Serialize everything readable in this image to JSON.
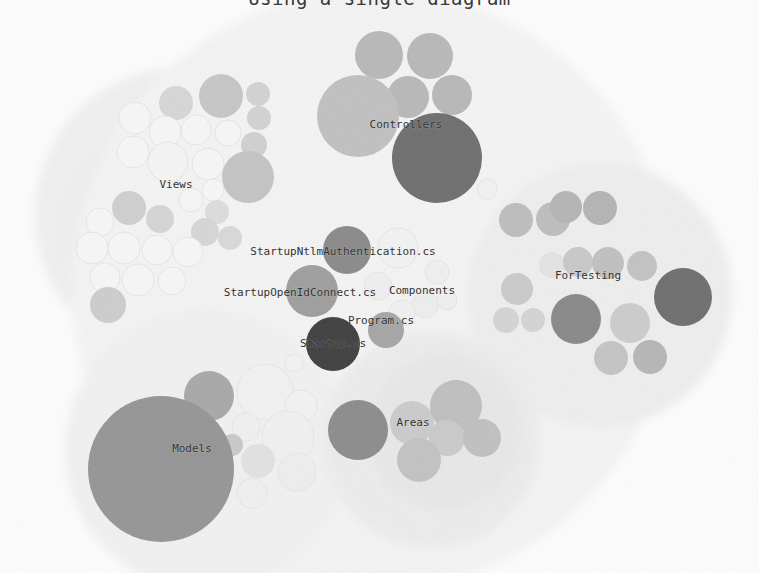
{
  "page": {
    "title_sliver": "Using a single diagram",
    "background_color": "#fdfdfd",
    "width": 759,
    "height": 573
  },
  "palette": {
    "hull": "#f0f0f0",
    "hull_inner": "#ececec",
    "leaf_faint": "#fafafa",
    "leaf_faint_stroke": "#e6e6e6",
    "leaf_light": "#d2d2d2",
    "leaf_mid": "#b8b8b8",
    "leaf_dark": "#8f8f8f",
    "leaf_darker": "#6e6e6e",
    "leaf_darkest": "#3f3f3f",
    "label": "#2b2b2b"
  },
  "chart_data": {
    "type": "bubble",
    "title": "Using a single diagram",
    "xlabel": "",
    "ylabel": "",
    "legend_position": "none",
    "grid": false,
    "xlim": [
      0,
      759
    ],
    "ylim": [
      0,
      573
    ],
    "labels": [
      {
        "text": "Controllers",
        "x": 406,
        "y": 125,
        "size": 11
      },
      {
        "text": "Views",
        "x": 176,
        "y": 185,
        "size": 11
      },
      {
        "text": "StartupNtlmAuthentication.cs",
        "x": 343,
        "y": 252,
        "size": 11
      },
      {
        "text": "StartupOpenIdConnect.cs",
        "x": 300,
        "y": 293,
        "size": 11
      },
      {
        "text": "Components",
        "x": 422,
        "y": 291,
        "size": 11
      },
      {
        "text": "Program.cs",
        "x": 381,
        "y": 321,
        "size": 11
      },
      {
        "text": "Startup.cs",
        "x": 333,
        "y": 344,
        "size": 11
      },
      {
        "text": "ForTesting",
        "x": 588,
        "y": 276,
        "size": 11
      },
      {
        "text": "Models",
        "x": 192,
        "y": 449,
        "size": 11
      },
      {
        "text": "Areas",
        "x": 413,
        "y": 423,
        "size": 11
      }
    ],
    "hulls": [
      {
        "name": "views-hull",
        "cx": 183,
        "cy": 215,
        "r": 148,
        "fill": "#f0f0f0"
      },
      {
        "name": "views-inner-hull",
        "cx": 168,
        "cy": 232,
        "r": 108,
        "fill": "#efefef"
      },
      {
        "name": "controllers-hull",
        "cx": 414,
        "cy": 140,
        "r": 118,
        "fill": "#f1f1f1"
      },
      {
        "name": "root-hull",
        "cx": 372,
        "cy": 290,
        "r": 300,
        "fill": "#f4f4f4"
      },
      {
        "name": "fortesting-hull",
        "cx": 600,
        "cy": 295,
        "r": 132,
        "fill": "#eeeeee"
      },
      {
        "name": "models-hull",
        "cx": 205,
        "cy": 450,
        "r": 140,
        "fill": "#f1f1f1"
      },
      {
        "name": "areas-hull",
        "cx": 432,
        "cy": 440,
        "r": 108,
        "fill": "#ececec"
      },
      {
        "name": "areas-inner-hull",
        "cx": 444,
        "cy": 432,
        "r": 78,
        "fill": "#e8e8e8"
      }
    ],
    "circles": [
      {
        "group": "Controllers",
        "cx": 379,
        "cy": 55,
        "r": 24,
        "fill": "#b8b8b8"
      },
      {
        "group": "Controllers",
        "cx": 430,
        "cy": 56,
        "r": 23,
        "fill": "#b8b8b8"
      },
      {
        "group": "Controllers",
        "cx": 408,
        "cy": 97,
        "r": 21,
        "fill": "#b8b8b8"
      },
      {
        "group": "Controllers",
        "cx": 452,
        "cy": 95,
        "r": 20,
        "fill": "#b8b8b8"
      },
      {
        "group": "Controllers",
        "cx": 358,
        "cy": 116,
        "r": 41,
        "fill": "#c0c0c0"
      },
      {
        "group": "Controllers",
        "cx": 437,
        "cy": 158,
        "r": 45,
        "fill": "#6e6e6e"
      },
      {
        "group": "Views",
        "cx": 221,
        "cy": 96,
        "r": 22,
        "fill": "#c6c6c6"
      },
      {
        "group": "Views",
        "cx": 176,
        "cy": 103,
        "r": 17,
        "fill": "#d6d6d6"
      },
      {
        "group": "Views",
        "cx": 258,
        "cy": 94,
        "r": 12,
        "fill": "#d2d2d2"
      },
      {
        "group": "Views",
        "cx": 259,
        "cy": 118,
        "r": 12,
        "fill": "#d2d2d2"
      },
      {
        "group": "Views",
        "cx": 135,
        "cy": 118,
        "r": 16,
        "fill": "#f7f7f7"
      },
      {
        "group": "Views",
        "cx": 165,
        "cy": 132,
        "r": 16,
        "fill": "#f7f7f7"
      },
      {
        "group": "Views",
        "cx": 196,
        "cy": 130,
        "r": 15,
        "fill": "#f7f7f7"
      },
      {
        "group": "Views",
        "cx": 228,
        "cy": 133,
        "r": 13,
        "fill": "#f7f7f7"
      },
      {
        "group": "Views",
        "cx": 254,
        "cy": 145,
        "r": 13,
        "fill": "#d0d0d0"
      },
      {
        "group": "Views",
        "cx": 133,
        "cy": 152,
        "r": 16,
        "fill": "#f7f7f7"
      },
      {
        "group": "Views",
        "cx": 168,
        "cy": 162,
        "r": 20,
        "fill": "#f5f5f5"
      },
      {
        "group": "Views",
        "cx": 208,
        "cy": 164,
        "r": 16,
        "fill": "#f7f7f7"
      },
      {
        "group": "Views",
        "cx": 248,
        "cy": 177,
        "r": 26,
        "fill": "#c4c4c4"
      },
      {
        "group": "Views",
        "cx": 213,
        "cy": 190,
        "r": 11,
        "fill": "#f7f7f7"
      },
      {
        "group": "Views",
        "cx": 191,
        "cy": 200,
        "r": 12,
        "fill": "#f6f6f6"
      },
      {
        "group": "Views",
        "cx": 217,
        "cy": 212,
        "r": 12,
        "fill": "#dcdcdc"
      },
      {
        "group": "Views",
        "cx": 129,
        "cy": 208,
        "r": 17,
        "fill": "#cfcfcf"
      },
      {
        "group": "Views",
        "cx": 160,
        "cy": 219,
        "r": 14,
        "fill": "#d5d5d5"
      },
      {
        "group": "Views",
        "cx": 100,
        "cy": 222,
        "r": 14,
        "fill": "#f7f7f7"
      },
      {
        "group": "Views",
        "cx": 205,
        "cy": 232,
        "r": 14,
        "fill": "#d6d6d6"
      },
      {
        "group": "Views",
        "cx": 230,
        "cy": 238,
        "r": 12,
        "fill": "#d8d8d8"
      },
      {
        "group": "Views",
        "cx": 92,
        "cy": 248,
        "r": 16,
        "fill": "#f7f7f7"
      },
      {
        "group": "Views",
        "cx": 124,
        "cy": 248,
        "r": 16,
        "fill": "#f7f7f7"
      },
      {
        "group": "Views",
        "cx": 157,
        "cy": 250,
        "r": 15,
        "fill": "#f7f7f7"
      },
      {
        "group": "Views",
        "cx": 188,
        "cy": 252,
        "r": 15,
        "fill": "#f7f7f7"
      },
      {
        "group": "Views",
        "cx": 105,
        "cy": 278,
        "r": 15,
        "fill": "#f7f7f7"
      },
      {
        "group": "Views",
        "cx": 138,
        "cy": 280,
        "r": 16,
        "fill": "#f7f7f7"
      },
      {
        "group": "Views",
        "cx": 172,
        "cy": 281,
        "r": 14,
        "fill": "#f7f7f7"
      },
      {
        "group": "Views",
        "cx": 108,
        "cy": 305,
        "r": 18,
        "fill": "#cdcdcd"
      },
      {
        "group": "Center",
        "cx": 347,
        "cy": 250,
        "r": 24,
        "fill": "#8a8a8a"
      },
      {
        "group": "Center",
        "cx": 398,
        "cy": 248,
        "r": 20,
        "fill": "#f3f3f3"
      },
      {
        "group": "Center",
        "cx": 312,
        "cy": 291,
        "r": 26,
        "fill": "#9e9e9e"
      },
      {
        "group": "Center",
        "cx": 378,
        "cy": 286,
        "r": 14,
        "fill": "#efefef"
      },
      {
        "group": "Center",
        "cx": 437,
        "cy": 272,
        "r": 12,
        "fill": "#f0f0f0"
      },
      {
        "group": "Center",
        "cx": 425,
        "cy": 305,
        "r": 13,
        "fill": "#eeeeee"
      },
      {
        "group": "Center",
        "cx": 447,
        "cy": 300,
        "r": 10,
        "fill": "#efefef"
      },
      {
        "group": "Center",
        "cx": 402,
        "cy": 313,
        "r": 13,
        "fill": "#f1f1f1"
      },
      {
        "group": "Center",
        "cx": 386,
        "cy": 330,
        "r": 18,
        "fill": "#a5a5a5"
      },
      {
        "group": "Center",
        "cx": 333,
        "cy": 344,
        "r": 27,
        "fill": "#3f3f3f"
      },
      {
        "group": "ForTesting",
        "cx": 516,
        "cy": 220,
        "r": 17,
        "fill": "#bdbdbd"
      },
      {
        "group": "ForTesting",
        "cx": 553,
        "cy": 219,
        "r": 17,
        "fill": "#bdbdbd"
      },
      {
        "group": "ForTesting",
        "cx": 566,
        "cy": 207,
        "r": 16,
        "fill": "#b4b4b4"
      },
      {
        "group": "ForTesting",
        "cx": 600,
        "cy": 208,
        "r": 17,
        "fill": "#b4b4b4"
      },
      {
        "group": "ForTesting",
        "cx": 552,
        "cy": 265,
        "r": 13,
        "fill": "#e4e4e4"
      },
      {
        "group": "ForTesting",
        "cx": 578,
        "cy": 262,
        "r": 15,
        "fill": "#c8c8c8"
      },
      {
        "group": "ForTesting",
        "cx": 608,
        "cy": 263,
        "r": 16,
        "fill": "#c0c0c0"
      },
      {
        "group": "ForTesting",
        "cx": 642,
        "cy": 266,
        "r": 15,
        "fill": "#c2c2c2"
      },
      {
        "group": "ForTesting",
        "cx": 517,
        "cy": 289,
        "r": 16,
        "fill": "#cacaca"
      },
      {
        "group": "ForTesting",
        "cx": 506,
        "cy": 320,
        "r": 13,
        "fill": "#d4d4d4"
      },
      {
        "group": "ForTesting",
        "cx": 533,
        "cy": 320,
        "r": 12,
        "fill": "#d4d4d4"
      },
      {
        "group": "ForTesting",
        "cx": 576,
        "cy": 319,
        "r": 25,
        "fill": "#888888"
      },
      {
        "group": "ForTesting",
        "cx": 630,
        "cy": 323,
        "r": 20,
        "fill": "#cccccc"
      },
      {
        "group": "ForTesting",
        "cx": 611,
        "cy": 358,
        "r": 17,
        "fill": "#c4c4c4"
      },
      {
        "group": "ForTesting",
        "cx": 650,
        "cy": 357,
        "r": 17,
        "fill": "#b6b6b6"
      },
      {
        "group": "ForTesting",
        "cx": 683,
        "cy": 297,
        "r": 29,
        "fill": "#6e6e6e"
      },
      {
        "group": "Models",
        "cx": 209,
        "cy": 396,
        "r": 25,
        "fill": "#a8a8a8"
      },
      {
        "group": "Models",
        "cx": 265,
        "cy": 392,
        "r": 28,
        "fill": "#f2f2f2"
      },
      {
        "group": "Models",
        "cx": 301,
        "cy": 406,
        "r": 16,
        "fill": "#f3f3f3"
      },
      {
        "group": "Models",
        "cx": 246,
        "cy": 427,
        "r": 14,
        "fill": "#f0f0f0"
      },
      {
        "group": "Models",
        "cx": 288,
        "cy": 437,
        "r": 26,
        "fill": "#f1f1f1"
      },
      {
        "group": "Models",
        "cx": 232,
        "cy": 445,
        "r": 11,
        "fill": "#c9c9c9"
      },
      {
        "group": "Models",
        "cx": 258,
        "cy": 461,
        "r": 17,
        "fill": "#e2e2e2"
      },
      {
        "group": "Models",
        "cx": 297,
        "cy": 472,
        "r": 19,
        "fill": "#eeeeee"
      },
      {
        "group": "Models",
        "cx": 252,
        "cy": 493,
        "r": 15,
        "fill": "#f0f0f0"
      },
      {
        "group": "Models",
        "cx": 161,
        "cy": 469,
        "r": 73,
        "fill": "#959595"
      },
      {
        "group": "Areas",
        "cx": 358,
        "cy": 430,
        "r": 30,
        "fill": "#8c8c8c"
      },
      {
        "group": "Areas",
        "cx": 412,
        "cy": 423,
        "r": 22,
        "fill": "#cbcbcb"
      },
      {
        "group": "Areas",
        "cx": 456,
        "cy": 406,
        "r": 26,
        "fill": "#bfbfbf"
      },
      {
        "group": "Areas",
        "cx": 447,
        "cy": 438,
        "r": 18,
        "fill": "#cacaca"
      },
      {
        "group": "Areas",
        "cx": 482,
        "cy": 438,
        "r": 19,
        "fill": "#c0c0c0"
      },
      {
        "group": "Areas",
        "cx": 419,
        "cy": 460,
        "r": 22,
        "fill": "#c2c2c2"
      },
      {
        "group": "Stray",
        "cx": 294,
        "cy": 363,
        "r": 9,
        "fill": "#f2f2f2"
      },
      {
        "group": "Stray",
        "cx": 487,
        "cy": 189,
        "r": 10,
        "fill": "#f2f2f2"
      }
    ]
  }
}
